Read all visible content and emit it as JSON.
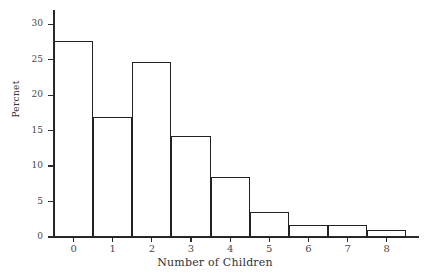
{
  "chart_data": {
    "type": "bar",
    "title": "",
    "xlabel": "Number of Children",
    "ylabel": "Percnet",
    "categories": [
      "0",
      "1",
      "2",
      "3",
      "4",
      "5",
      "6",
      "7",
      "8"
    ],
    "values": [
      27.6,
      16.9,
      24.7,
      14.2,
      8.4,
      3.5,
      1.7,
      1.7,
      1.0
    ],
    "ylim": [
      0,
      32
    ],
    "yticks": [
      0,
      5,
      10,
      15,
      20,
      25,
      30
    ],
    "ytick_labels": [
      "0",
      "5",
      "10",
      "15",
      "20",
      "25",
      "30"
    ],
    "xtick_labels": [
      "0",
      "1",
      "2",
      "3",
      "4",
      "5",
      "6",
      "7",
      "8"
    ],
    "grid": false,
    "legend": false,
    "bar_edge_color": "#222222",
    "bar_fill_color": "none",
    "axis_color": "#2b2b2b",
    "background_color": "#ffffff"
  }
}
